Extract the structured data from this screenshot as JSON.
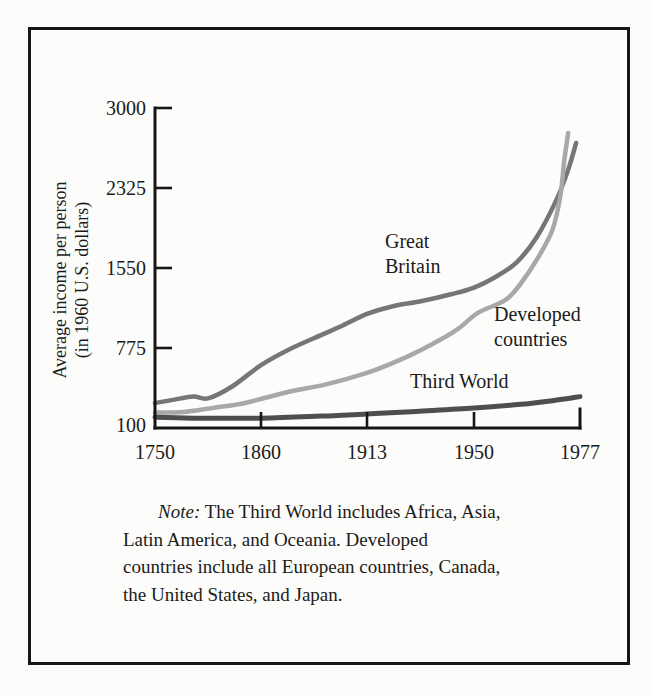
{
  "figure": {
    "border_color": "#161616",
    "background_color": "#fcfcfa"
  },
  "y_axis": {
    "title_line1": "Average income per person",
    "title_line2": "(in 1960 U.S. dollars)",
    "ticks": [
      {
        "label": "3000",
        "value": 3000
      },
      {
        "label": "2325",
        "value": 2325
      },
      {
        "label": "1550",
        "value": 1550
      },
      {
        "label": "775",
        "value": 775
      },
      {
        "label": "100",
        "value": 100
      }
    ]
  },
  "x_axis": {
    "ticks": [
      {
        "label": "1750",
        "year": 1750
      },
      {
        "label": "1860",
        "year": 1860
      },
      {
        "label": "1913",
        "year": 1913
      },
      {
        "label": "1950",
        "year": 1950
      },
      {
        "label": "1977",
        "year": 1977
      }
    ]
  },
  "series_labels": {
    "great_britain_line1": "Great",
    "great_britain_line2": "Britain",
    "developed_line1": "Developed",
    "developed_line2": "countries",
    "third_world": "Third World"
  },
  "note": {
    "label": "Note:",
    "line1_rest": " The Third World includes Africa, Asia,",
    "line2": "Latin America, and Oceania. Developed",
    "line3": "countries include all European countries, Canada,",
    "line4": "the United States, and Japan."
  },
  "chart_data": {
    "type": "line",
    "title": "",
    "xlabel": "Year",
    "ylabel": "Average income per person (in 1960 U.S. dollars)",
    "x_ticks": [
      1750,
      1860,
      1913,
      1950,
      1977
    ],
    "y_ticks": [
      100,
      775,
      1550,
      2325,
      3000
    ],
    "axis_note": "Both axes are non-uniform: labeled years and labeled dollar values are equally spaced on the page.",
    "legend_position": "labels beside curves",
    "grid": false,
    "series": [
      {
        "name": "Great Britain",
        "color": "#767676",
        "points": [
          [
            1750,
            310
          ],
          [
            1770,
            340
          ],
          [
            1790,
            365
          ],
          [
            1805,
            350
          ],
          [
            1830,
            450
          ],
          [
            1860,
            630
          ],
          [
            1875,
            770
          ],
          [
            1890,
            900
          ],
          [
            1900,
            985
          ],
          [
            1913,
            1105
          ],
          [
            1922,
            1180
          ],
          [
            1932,
            1230
          ],
          [
            1942,
            1295
          ],
          [
            1950,
            1360
          ],
          [
            1956,
            1475
          ],
          [
            1961,
            1610
          ],
          [
            1966,
            1850
          ],
          [
            1971,
            2210
          ],
          [
            1974,
            2480
          ],
          [
            1976,
            2705
          ]
        ]
      },
      {
        "name": "Developed countries",
        "color": "#a8a8a8",
        "points": [
          [
            1750,
            230
          ],
          [
            1780,
            235
          ],
          [
            1810,
            270
          ],
          [
            1840,
            305
          ],
          [
            1860,
            345
          ],
          [
            1875,
            410
          ],
          [
            1893,
            470
          ],
          [
            1913,
            565
          ],
          [
            1924,
            670
          ],
          [
            1935,
            805
          ],
          [
            1944,
            950
          ],
          [
            1951,
            1115
          ],
          [
            1958,
            1240
          ],
          [
            1962,
            1405
          ],
          [
            1966,
            1630
          ],
          [
            1970,
            1920
          ],
          [
            1972,
            2250
          ],
          [
            1973,
            2560
          ],
          [
            1974,
            2790
          ]
        ]
      },
      {
        "name": "Third World",
        "color": "#4e4e4e",
        "points": [
          [
            1750,
            190
          ],
          [
            1790,
            183
          ],
          [
            1860,
            183
          ],
          [
            1890,
            200
          ],
          [
            1913,
            218
          ],
          [
            1930,
            240
          ],
          [
            1950,
            268
          ],
          [
            1962,
            300
          ],
          [
            1970,
            330
          ],
          [
            1977,
            365
          ]
        ]
      }
    ]
  }
}
